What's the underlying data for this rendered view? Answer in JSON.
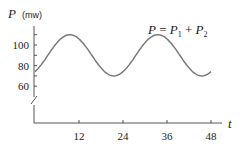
{
  "chart_data": {
    "type": "line",
    "title": "",
    "xlabel": "t",
    "ylabel": "P (mw)",
    "ylabel_var": "P",
    "ylabel_unit": "(mw)",
    "annotation": "P = P1 + P2",
    "annotation_parts": {
      "lhs": "P",
      "eq": " = ",
      "p1": "P",
      "s1": "1",
      "plus": " + ",
      "p2": "P",
      "s2": "2"
    },
    "x_ticks": [
      12,
      24,
      36,
      48
    ],
    "x_tick_labels": [
      "12",
      "24",
      "36",
      "48"
    ],
    "y_ticks": [
      60,
      80,
      100
    ],
    "y_tick_labels": [
      "60",
      "80",
      "100"
    ],
    "y_minor_ticks": [
      70,
      90,
      110
    ],
    "xlim": [
      0,
      49
    ],
    "ylim": [
      40,
      115
    ],
    "y_axis_break": true,
    "grid": false,
    "legend": null,
    "series": [
      {
        "name": "P = P1 + P2",
        "color": "#7a7a7a",
        "x": [
          0,
          3,
          6,
          9.5,
          12,
          15,
          18,
          21.5,
          24,
          27,
          30,
          33.5,
          36,
          39,
          42,
          45.5,
          48
        ],
        "values": [
          74,
          80,
          87,
          110,
          108,
          100,
          86,
          70,
          72,
          80,
          94,
          110,
          108,
          100,
          86,
          70,
          74
        ]
      }
    ],
    "model": {
      "mean": 90,
      "amplitude": 20,
      "period": 24,
      "phase_shift": 3.5
    }
  }
}
